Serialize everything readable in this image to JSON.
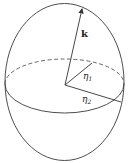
{
  "diagram": {
    "colors": {
      "stroke": "#3a3a3a",
      "background": "#ffffff"
    },
    "labels": {
      "k": "k",
      "eta1": "η",
      "eta1_sub": "1",
      "eta2": "η",
      "eta2_sub": "2"
    }
  }
}
